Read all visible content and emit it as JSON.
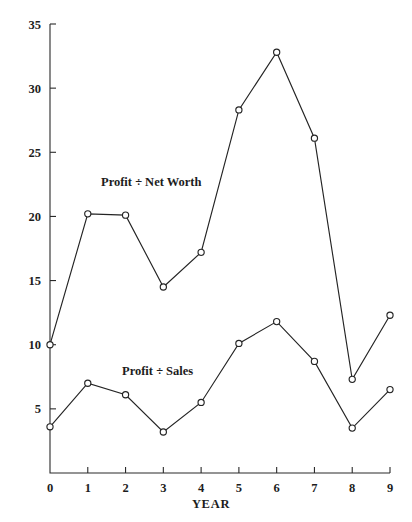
{
  "chart_data": {
    "type": "line",
    "title": "",
    "xlabel": "YEAR",
    "ylabel": "",
    "xlim": [
      0,
      9
    ],
    "ylim": [
      0,
      35
    ],
    "grid": false,
    "legend_position": "inline-annotation",
    "x": [
      0,
      1,
      2,
      3,
      4,
      5,
      6,
      7,
      8,
      9
    ],
    "xticks": [
      "0",
      "1",
      "2",
      "3",
      "4",
      "5",
      "6",
      "7",
      "8",
      "9"
    ],
    "yticks": [
      "5",
      "10",
      "15",
      "20",
      "25",
      "30",
      "35"
    ],
    "ytick_values": [
      5,
      10,
      15,
      20,
      25,
      30,
      35
    ],
    "series": [
      {
        "name": "Profit ÷ Net Worth",
        "values": [
          10.0,
          20.2,
          20.1,
          14.5,
          17.2,
          28.3,
          32.8,
          26.1,
          7.3,
          12.3
        ],
        "marker": "open-circle",
        "color": "#242424"
      },
      {
        "name": "Profit ÷ Sales",
        "values": [
          3.6,
          7.0,
          6.1,
          3.2,
          5.5,
          10.1,
          11.8,
          8.7,
          3.5,
          6.5
        ],
        "marker": "open-circle",
        "color": "#242424"
      }
    ],
    "annotations": [
      {
        "text": "Profit ÷ Net Worth",
        "x_px": 101,
        "y_px": 186
      },
      {
        "text": "Profit ÷ Sales",
        "x_px": 122,
        "y_px": 375
      }
    ]
  }
}
